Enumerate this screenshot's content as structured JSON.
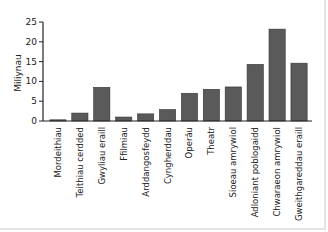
{
  "chart_data": {
    "type": "bar",
    "title": "",
    "xlabel": "",
    "ylabel": "Miliynau",
    "ylim": [
      0,
      25
    ],
    "yticks": [
      0,
      5,
      10,
      15,
      20,
      25
    ],
    "grid": false,
    "legend": null,
    "bar_color": "#5a5a5a",
    "categories": [
      "Mordeithiau",
      "Teithiau cerdded",
      "Gwyliau eraill",
      "Ffilmiau",
      "Arddangosfeydd",
      "Cyngherddau",
      "Operâu",
      "Theatr",
      "Sioeau amrywiol",
      "Adloniant poblogaidd",
      "Chwaraeon amrywiol",
      "Gweithgareddau eraill"
    ],
    "values": [
      0.3,
      2,
      8.5,
      1,
      1.8,
      2.9,
      7,
      8,
      8.6,
      14.3,
      23.2,
      14.6
    ]
  }
}
